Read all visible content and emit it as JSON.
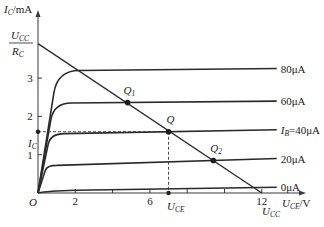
{
  "figure": {
    "y_axis_label": "I",
    "y_axis_label_sub": "C",
    "y_axis_unit": "/mA",
    "x_axis_label": "U",
    "x_axis_label_sub": "CE",
    "x_axis_unit": "/V",
    "origin_label": "O",
    "x_ticks": [
      2,
      4,
      6,
      8,
      10,
      12
    ],
    "x_tick_labels": [
      "2",
      "",
      "6",
      "",
      "",
      "12"
    ],
    "y_ticks": [
      1,
      2,
      3
    ],
    "y_tick_labels": [
      "1",
      "2",
      "3"
    ],
    "ucc_over_rc": {
      "num": "U",
      "num_sub": "CC",
      "den": "R",
      "den_sub": "C"
    },
    "ic_label": {
      "main": "I",
      "sub": "C"
    },
    "uce_label": {
      "main": "U",
      "sub": "CE"
    },
    "ucc_label": {
      "main": "U",
      "sub": "CC"
    },
    "curve_labels": [
      "80μA",
      "60μA",
      "I_B=40μA",
      "20μA",
      "0μA"
    ],
    "ib_prefix": "I",
    "ib_sub": "B",
    "ib_value": "=40μA",
    "points": {
      "Q1": "Q",
      "Q1_sub": "1",
      "Q": "Q",
      "Q2": "Q",
      "Q2_sub": "2"
    }
  },
  "chart_data": {
    "type": "line",
    "title": "",
    "xlabel": "U_CE/V",
    "ylabel": "I_C/mA",
    "xlim": [
      0,
      13.5
    ],
    "ylim": [
      0,
      4.4
    ],
    "grid": false,
    "series": [
      {
        "name": "80μA",
        "ib_uA": 80,
        "saturation_mA": 3.2,
        "end_mA": 3.25
      },
      {
        "name": "60μA",
        "ib_uA": 60,
        "saturation_mA": 2.35,
        "end_mA": 2.4
      },
      {
        "name": "I_B=40μA",
        "ib_uA": 40,
        "saturation_mA": 1.55,
        "end_mA": 1.65
      },
      {
        "name": "20μA",
        "ib_uA": 20,
        "saturation_mA": 0.72,
        "end_mA": 0.9
      },
      {
        "name": "0μA",
        "ib_uA": 0,
        "saturation_mA": 0.05,
        "end_mA": 0.15
      }
    ],
    "load_line": {
      "x": [
        0,
        12
      ],
      "y": [
        3.9,
        0
      ],
      "x_label": "U_CC",
      "y_label": "U_CC/R_C"
    },
    "operating_points": [
      {
        "name": "Q1",
        "x": 4.8,
        "y": 2.36
      },
      {
        "name": "Q",
        "x": 7.0,
        "y": 1.6
      },
      {
        "name": "Q2",
        "x": 9.4,
        "y": 0.85
      }
    ],
    "annotations": [
      {
        "text": "I_C",
        "at_y": 1.6
      },
      {
        "text": "U_CE",
        "at_x": 7.0
      }
    ]
  }
}
